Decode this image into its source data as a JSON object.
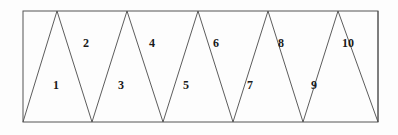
{
  "figure": {
    "colors": {
      "background": "#fdfdfd",
      "stroke": "#4a4a4a",
      "border_stroke": "#555555",
      "label_color": "#1a1a1a"
    },
    "rectangle": {
      "x": 23,
      "y": 11,
      "width": 355,
      "height": 111,
      "left": 23,
      "right": 378,
      "top": 11,
      "bottom": 122
    },
    "top_vertices_x": [
      23,
      57,
      127,
      198,
      268,
      338,
      378
    ],
    "bottom_vertices_x": [
      23,
      92,
      163,
      233,
      303,
      378
    ],
    "zigzag_path": "M 23,122 L 57,11 L 92,122 L 127,11 L 163,122 L 198,11 L 233,122 L 268,11 L 303,122 L 338,11 L 378,122 L 378,11",
    "triangle_count": 10,
    "triangles": [
      {
        "id": 1,
        "label": "1",
        "label_x": 56,
        "label_y": 85,
        "orientation": "up"
      },
      {
        "id": 2,
        "label": "2",
        "label_x": 86,
        "label_y": 43,
        "orientation": "down"
      },
      {
        "id": 3,
        "label": "3",
        "label_x": 121,
        "label_y": 85,
        "orientation": "up"
      },
      {
        "id": 4,
        "label": "4",
        "label_x": 152,
        "label_y": 43,
        "orientation": "down"
      },
      {
        "id": 5,
        "label": "5",
        "label_x": 186,
        "label_y": 85,
        "orientation": "up"
      },
      {
        "id": 6,
        "label": "6",
        "label_x": 216,
        "label_y": 43,
        "orientation": "down"
      },
      {
        "id": 7,
        "label": "7",
        "label_x": 250,
        "label_y": 85,
        "orientation": "up"
      },
      {
        "id": 8,
        "label": "8",
        "label_x": 281,
        "label_y": 43,
        "orientation": "down"
      },
      {
        "id": 9,
        "label": "9",
        "label_x": 314,
        "label_y": 85,
        "orientation": "up"
      },
      {
        "id": 10,
        "label": "10",
        "label_x": 348,
        "label_y": 43,
        "orientation": "down"
      }
    ]
  }
}
